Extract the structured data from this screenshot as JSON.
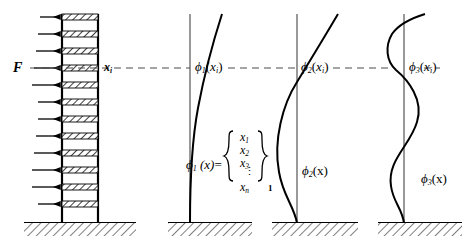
{
  "figure": {
    "type": "engineering-diagram"
  },
  "building": {
    "force_label": "F",
    "station_label": "x",
    "station_sub": "i",
    "floors": 12,
    "arrow_count": 12,
    "arrow_directions": [
      "right",
      "right",
      "right",
      "left",
      "left",
      "right",
      "right",
      "right",
      "right",
      "left",
      "left",
      "right"
    ],
    "slab_fill": "hatched",
    "ground_fill": "hatched"
  },
  "panels": [
    {
      "id": "mode-1",
      "symbol": "ϕ",
      "mode_number": "1",
      "node_label_base": "(",
      "top_label_text": "(x",
      "top_label_sub": "i",
      "top_label_tail": ")",
      "base_label_text": "(x)",
      "nodes": 0,
      "vector": {
        "equals": "=",
        "entries": [
          "x",
          "x",
          "x",
          "⋮",
          "x"
        ],
        "entry_subs": [
          "1",
          "2",
          "3",
          "",
          "n"
        ],
        "outer_sub": "1"
      }
    },
    {
      "id": "mode-2",
      "symbol": "ϕ",
      "mode_number": "2",
      "top_label_text": "(x",
      "top_label_sub": "i",
      "top_label_tail": ")",
      "base_label_text": "(x)",
      "nodes": 1
    },
    {
      "id": "mode-3",
      "symbol": "ϕ",
      "mode_number": "3",
      "top_label_text": "(x",
      "top_label_sub": "i",
      "top_label_tail": ")",
      "base_label_text": "(x)",
      "nodes": 2
    }
  ],
  "colors": {
    "stroke": "#000000",
    "background": "#ffffff",
    "axis": "#555555",
    "dashed": "#4d4d4d"
  }
}
